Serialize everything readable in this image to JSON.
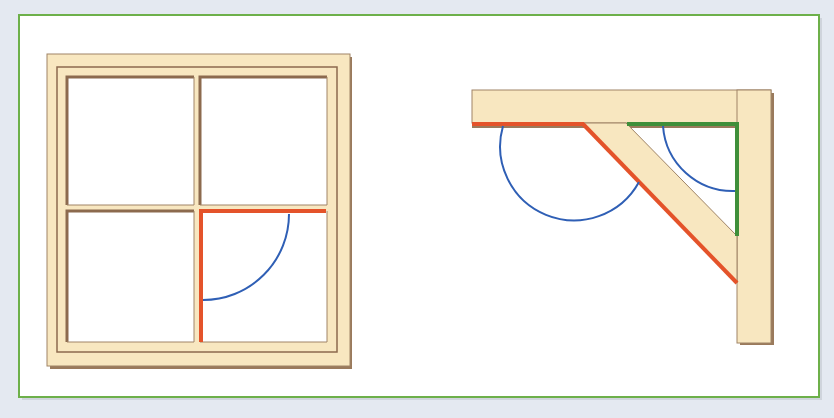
{
  "figure": {
    "colors": {
      "background": "#e4e9f1",
      "panel_fill": "#ffffff",
      "panel_border": "#6db04a",
      "wood": "#f8e7c0",
      "wood_edge": "#8c6a4e",
      "wood_shadow": "#9a7a5c",
      "highlight_red": "#e4532a",
      "highlight_green": "#3f8f3a",
      "angle_arc": "#2f5fb5"
    },
    "window": {
      "name": "Window frame",
      "panes": 4,
      "highlighted_angle": "right angle between red mullion and red transom in lower-right pane"
    },
    "bracket": {
      "name": "Shelf bracket",
      "highlighted_angles": [
        "obtuse angle between red shelf underside and red diagonal brace",
        "right angle between green shelf underside and green upright"
      ]
    }
  }
}
